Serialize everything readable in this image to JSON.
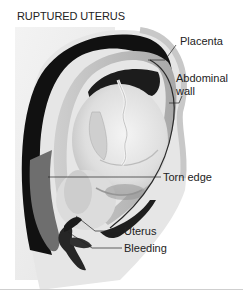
{
  "figure": {
    "title": "RUPTURED UTERUS",
    "labels": [
      {
        "id": "placenta",
        "text": "Placenta"
      },
      {
        "id": "abdominal-wall",
        "text": "Abdominal\nwall",
        "lines": [
          "Abdominal",
          "wall"
        ]
      },
      {
        "id": "torn-edge",
        "text": "Torn edge"
      },
      {
        "id": "uterus",
        "text": "Uterus"
      },
      {
        "id": "bleeding",
        "text": "Bleeding"
      }
    ],
    "colors": {
      "background": "#ffffff",
      "panel": "#eeeeee",
      "dark_cavity": "#111111",
      "skin": "#d9d9d9",
      "uterine_wall": "#bdbdbd",
      "blood": "#2a2a2a",
      "leader_line": "#222222",
      "text": "#222222"
    }
  }
}
